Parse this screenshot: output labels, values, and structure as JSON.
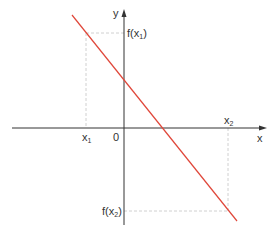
{
  "diagram": {
    "type": "decreasing-linear-function-graph",
    "axes": {
      "x_label": "x",
      "y_label": "y",
      "origin_label": "0",
      "color": "#333333"
    },
    "line": {
      "color": "#e0473a",
      "from": [
        72,
        15
      ],
      "to": [
        237,
        221
      ]
    },
    "guides": {
      "color": "#bbbbbb",
      "x1_label": "x",
      "x1_sub": "1",
      "x2_label": "x",
      "x2_sub": "2",
      "fx1_prefix": "f(x",
      "fx1_sub": "1",
      "fx1_suffix": ")",
      "fx2_prefix": "f(x",
      "fx2_sub": "2",
      "fx2_suffix": ")"
    }
  }
}
